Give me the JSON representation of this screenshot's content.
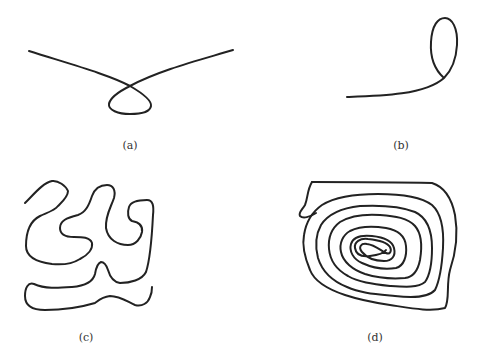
{
  "figure": {
    "panels": [
      {
        "id": "a",
        "label": "(a)",
        "description": "curve with a single small loop crossing"
      },
      {
        "id": "b",
        "label": "(b)",
        "description": "curve ending in a loop"
      },
      {
        "id": "c",
        "label": "(c)",
        "description": "long meandering non-self-intersecting curve"
      },
      {
        "id": "d",
        "label": "(d)",
        "description": "tight spiral curve"
      }
    ],
    "stroke_color": "#222222",
    "background": "#ffffff"
  }
}
